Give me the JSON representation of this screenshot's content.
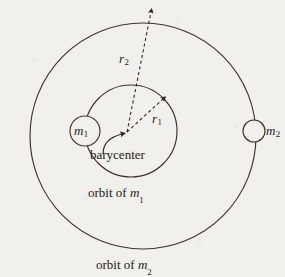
{
  "figure": {
    "background_color": "#f2f0ec",
    "ink_color": "#262220",
    "labels": {
      "mass1": "m",
      "mass1_sub": "1",
      "mass2": "m",
      "mass2_sub": "2",
      "radius1": "r",
      "radius1_sub": "1",
      "radius2": "r",
      "radius2_sub": "2",
      "barycenter": "barycenter",
      "orbit_of_m1_prefix": "orbit of ",
      "orbit_of_m1_symbol": "m",
      "orbit_of_m1_sub": "1",
      "orbit_of_m2_prefix": "orbit of ",
      "orbit_of_m2_symbol": "m",
      "orbit_of_m2_sub": "2"
    },
    "geometry": {
      "outer_orbit": {
        "cx": 143,
        "cy": 136,
        "r": 113,
        "stroke": "#3a3330",
        "stroke_width": 1.1
      },
      "inner_orbit": {
        "cx": 131,
        "cy": 131,
        "r": 46,
        "stroke": "#3a3330",
        "stroke_width": 1.1
      },
      "barycenter_point": {
        "x": 127,
        "y": 132
      },
      "body_m1": {
        "cx": 85,
        "cy": 131,
        "r": 15,
        "stroke": "#3a3330",
        "stroke_width": 1.1
      },
      "body_m2": {
        "cx": 254,
        "cy": 131,
        "r": 11,
        "stroke": "#3a3330",
        "stroke_width": 1.1
      },
      "arrow_r1": {
        "x1": 127,
        "y1": 132,
        "x2": 165,
        "y2": 97,
        "style": "dashed"
      },
      "arrow_r2": {
        "x1": 127,
        "y1": 132,
        "x2": 152,
        "y2": 9,
        "style": "dashed"
      },
      "barycenter_pointer": {
        "from_x": 105,
        "from_y": 152,
        "to_x": 124,
        "to_y": 136,
        "style": "curved-solid"
      }
    }
  }
}
